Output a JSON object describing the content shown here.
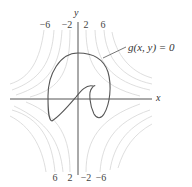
{
  "figure": {
    "axes": {
      "x_label": "x",
      "y_label": "y"
    },
    "curve_label": "g(x, y) = 0",
    "top_contour_labels": [
      "−6",
      "−2",
      "2",
      "6"
    ],
    "bottom_contour_labels": [
      "6",
      "2",
      "−2",
      "−6"
    ],
    "colors": {
      "curve": "#555555",
      "axes": "#555555",
      "contours": "#d4d4d4",
      "background": "#ffffff"
    }
  }
}
